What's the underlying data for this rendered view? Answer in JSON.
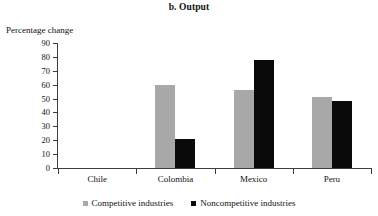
{
  "chart_data": {
    "type": "bar",
    "title": "b. Output",
    "ylabel": "Percentage change",
    "xlabel": "",
    "ylim": [
      0,
      90
    ],
    "yticks": [
      90,
      80,
      70,
      60,
      50,
      40,
      30,
      20,
      10,
      0
    ],
    "grid": false,
    "legend_position": "bottom",
    "categories": [
      "Chile",
      "Colombia",
      "Mexico",
      "Peru"
    ],
    "series": [
      {
        "name": "Competitive industries",
        "color": "#a8a8a8",
        "values": [
          0,
          60,
          56,
          51
        ]
      },
      {
        "name": "Noncompetitive industries",
        "color": "#0a0a0a",
        "values": [
          0,
          21,
          78,
          48
        ]
      }
    ]
  },
  "legend": {
    "items": [
      {
        "label": "Competitive industries",
        "swatch": "gray-square-icon"
      },
      {
        "label": "Noncompetitive industries",
        "swatch": "black-square-icon"
      }
    ]
  }
}
